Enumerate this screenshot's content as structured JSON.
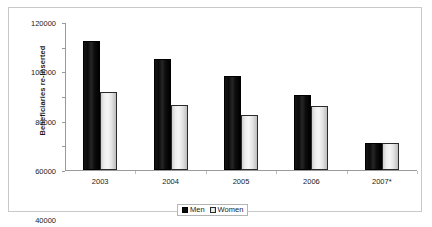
{
  "chart_data": {
    "type": "bar",
    "title": "",
    "subtitle": "",
    "xlabel": "",
    "ylabel": "Beneficiaries re-inserted",
    "categories": [
      "2003",
      "2004",
      "2005",
      "2006",
      "2007*"
    ],
    "series": [
      {
        "name": "Men",
        "color": "#0a0a0a",
        "values": [
          105000,
          90000,
          76000,
          61000,
          22000
        ]
      },
      {
        "name": "Women",
        "color": "#ededed",
        "values": [
          63000,
          53000,
          45000,
          52000,
          22000
        ]
      }
    ],
    "ylim": [
      0,
      120000
    ],
    "y_ticks": [
      0,
      20000,
      40000,
      60000,
      80000,
      100000,
      120000
    ],
    "y_tick_labels": [
      "0",
      "20000",
      "40000",
      "60000",
      "80000",
      "100000",
      "120000"
    ],
    "grid": false,
    "legend_position": "bottom",
    "legend_entries": [
      "Men",
      "Women"
    ],
    "annotations": []
  },
  "frame": {
    "border_color": "#c9c9c9",
    "background": "#ffffff"
  }
}
